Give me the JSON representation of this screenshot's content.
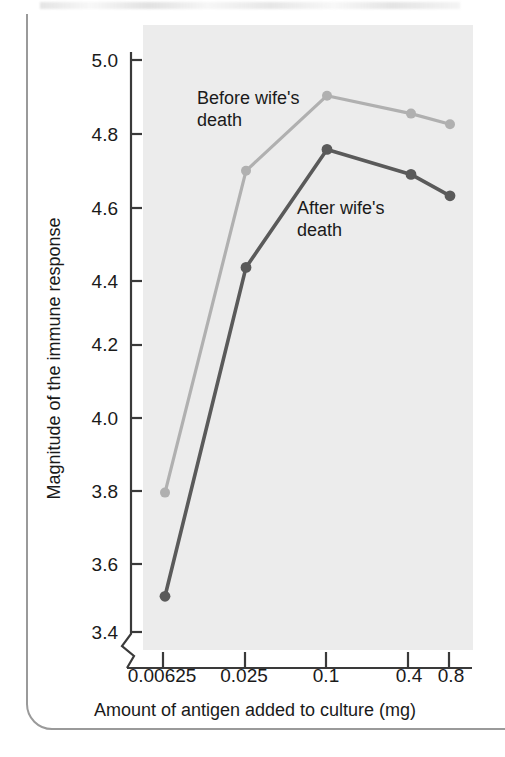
{
  "chart_data": {
    "type": "line",
    "title": "",
    "xlabel": "Amount of antigen added to culture (mg)",
    "ylabel": "Magnitude of the immune response",
    "categories": [
      "0.00625",
      "0.025",
      "0.1",
      "0.4",
      "0.8"
    ],
    "x_tick_labels": [
      "0.00625",
      "0.025",
      "0.1",
      "0.4",
      "0.8"
    ],
    "y_tick_labels": [
      "3.4",
      "3.6",
      "3.8",
      "4.0",
      "4.2",
      "4.4",
      "4.6",
      "4.8",
      "5.0"
    ],
    "ylim": [
      3.4,
      5.0
    ],
    "y_axis_break": true,
    "grid": false,
    "legend": "inline-annotations",
    "plot_background": "#ececec",
    "series": [
      {
        "name": "Before wife's death",
        "label": "Before wife's\ndeath",
        "color": "#b0b0b0",
        "values": [
          3.79,
          4.69,
          4.9,
          4.85,
          4.82
        ]
      },
      {
        "name": "After wife's death",
        "label": "After wife's\ndeath",
        "color": "#5a5a5a",
        "values": [
          3.5,
          4.42,
          4.75,
          4.68,
          4.62
        ]
      }
    ]
  },
  "axes": {
    "y_title": "Magnitude of the immune response",
    "x_title": "Amount of antigen added to culture (mg)",
    "y_ticks": [
      "5.0",
      "4.8",
      "4.6",
      "4.4",
      "4.2",
      "4.0",
      "3.8",
      "3.6",
      "3.4"
    ],
    "x_ticks": [
      "0.00625",
      "0.025",
      "0.1",
      "0.4",
      "0.8"
    ]
  },
  "annotations": {
    "before_line1": "Before wife's",
    "before_line2": "death",
    "after_line1": "After wife's",
    "after_line2": "death"
  },
  "colors": {
    "before_series": "#b0b0b0",
    "after_series": "#5a5a5a",
    "plot_bg": "#ececec",
    "axis": "#3a3a3a",
    "text": "#1a1a1a"
  }
}
